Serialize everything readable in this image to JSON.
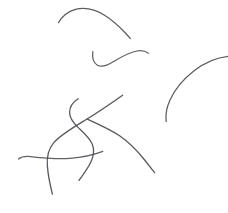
{
  "canvas": {
    "name": "line-sketch",
    "width": 228,
    "height": 213,
    "background_color": "#ffffff",
    "ink_color": "#4a4a52",
    "stroke_count": 6,
    "description": "Minimal freehand line drawing of six thin curved strokes on a blank white field"
  },
  "strokes": [
    {
      "id": "stroke-top-arc",
      "label": "top arc",
      "color": "#545459",
      "width": 1.25,
      "opacity": 0.95,
      "path": "M58.5,22.6 C61.5,17.4 66.8,12.0 74.6,9.6 C84.0,6.8 95.4,9.4 104.6,15.2 C113.4,20.7 120.4,27.6 125.6,33.2 C128.2,36.0 129.6,37.6 130.4,38.6"
    },
    {
      "id": "stroke-s-curve-upper",
      "label": "upper s-curve",
      "color": "#545459",
      "width": 1.25,
      "opacity": 0.95,
      "path": "M92.8,51.6 C92.0,57.6 93.6,62.8 97.4,65.2 C101.6,67.8 107.0,65.6 113.2,61.8 C121.4,56.8 129.8,52.2 137.0,51.0 C142.0,50.2 145.8,51.4 148.4,53.2"
    },
    {
      "id": "stroke-right-quarter-arc",
      "label": "right quarter arc",
      "color": "#545459",
      "width": 1.25,
      "opacity": 0.95,
      "path": "M228.0,56.4 C217.0,57.6 205.0,62.4 194.4,70.6 C183.0,79.4 174.4,90.2 169.8,100.6 C166.6,107.8 165.4,114.8 166.2,121.4"
    },
    {
      "id": "stroke-long-hook",
      "label": "long descending hook",
      "color": "#4e4e54",
      "width": 1.3,
      "opacity": 0.95,
      "path": "M78.2,98.8 C73.0,102.0 69.6,107.2 69.6,112.6 C69.6,118.4 73.6,123.2 78.0,127.4 C83.4,132.6 89.2,137.4 92.0,143.6 C94.4,149.0 94.0,155.2 91.0,161.8 C88.0,168.4 83.2,174.6 79.0,180.4"
    },
    {
      "id": "stroke-horizontal",
      "label": "near-horizontal stroke",
      "color": "#555559",
      "width": 1.2,
      "opacity": 0.92,
      "path": "M18.6,159.0 C21.4,156.6 25.0,156.0 30.4,156.6 C41.0,157.8 56.0,159.4 70.0,158.4 C83.0,157.4 94.4,154.6 102.8,151.4"
    },
    {
      "id": "stroke-long-diagonal",
      "label": "long diagonal sweep",
      "color": "#4e4e54",
      "width": 1.3,
      "opacity": 0.95,
      "path": "M122.6,95.2 C113.0,102.0 101.0,110.4 87.0,119.0 C73.0,127.6 60.4,134.8 53.6,142.8 C48.0,149.4 46.6,157.6 47.4,166.4 C48.2,176.2 50.4,186.2 52.4,194.2"
    },
    {
      "id": "stroke-diagonal-tail",
      "label": "diagonal lower tail",
      "color": "#4e4e54",
      "width": 1.3,
      "opacity": 0.95,
      "path": "M87.0,119.0 C99.0,124.4 110.4,129.4 119.6,135.8 C129.4,142.6 137.4,151.0 143.8,159.0 C148.6,165.0 152.2,169.6 154.6,172.6"
    }
  ]
}
